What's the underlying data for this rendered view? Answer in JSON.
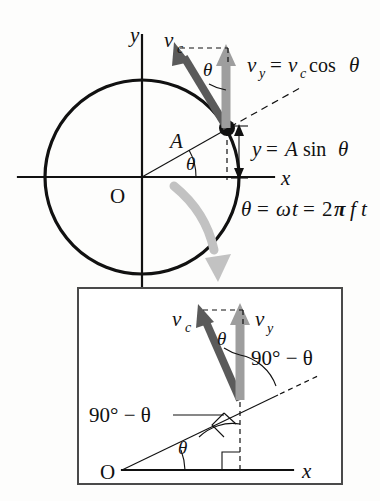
{
  "figure": {
    "background_color": "#fdfdfc"
  },
  "colors": {
    "ink": "#111111",
    "vc_arrow": "#5a5a5a",
    "vy_arrow": "#9e9e9e",
    "rotation_arrow": "#b9b9b9",
    "box_frame": "#4a4a4a"
  },
  "main_diagram": {
    "axis_labels": {
      "y_axis": "y",
      "x_axis": "x",
      "origin": "O"
    },
    "radius_label": "A",
    "angle_label": "θ",
    "velocity_labels": {
      "tangential": "v",
      "tangential_sub": "c",
      "vertical": "v",
      "vertical_sub": "y"
    },
    "vc_angle_label": "θ",
    "equations": {
      "vy_equation": "v_y = v_c cos θ",
      "vy_parts": {
        "v1": "v",
        "sub1": "y",
        "eq1": "=",
        "v2": "v",
        "sub2": "c",
        "func": "cos",
        "theta": "θ"
      },
      "y_equation": "y = A sin θ",
      "y_parts": {
        "y": "y",
        "eq": "=",
        "A": "A",
        "func": "sin",
        "theta": "θ"
      },
      "theta_equation": "θ = ωt = 2πft",
      "theta_parts": {
        "theta": "θ",
        "eq1": "=",
        "omega": "ω",
        "t1": "t",
        "eq2": "=",
        "two": "2",
        "pi": "π",
        "f": "f",
        "t2": "t"
      }
    }
  },
  "inset_diagram": {
    "velocity_labels": {
      "tangential": "v",
      "tangential_sub": "c",
      "vertical": "v",
      "vertical_sub": "y"
    },
    "angle_labels": {
      "theta_top": "θ",
      "theta_bottom": "θ",
      "complement_right": "90° − θ",
      "complement_left": "90° − θ"
    },
    "axis_labels": {
      "origin": "O",
      "x_axis": "x"
    }
  }
}
